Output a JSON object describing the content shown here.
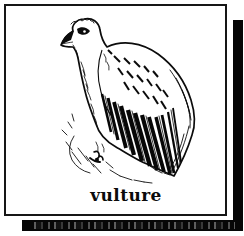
{
  "page": {
    "background_color": "#ffffff"
  },
  "flashcard": {
    "caption": "vulture",
    "illustration": "vulture-line-drawing"
  },
  "colors": {
    "ink": "#0b0b0b",
    "paper": "#ffffff",
    "shadow_square": "#060606",
    "border": "#161616"
  }
}
